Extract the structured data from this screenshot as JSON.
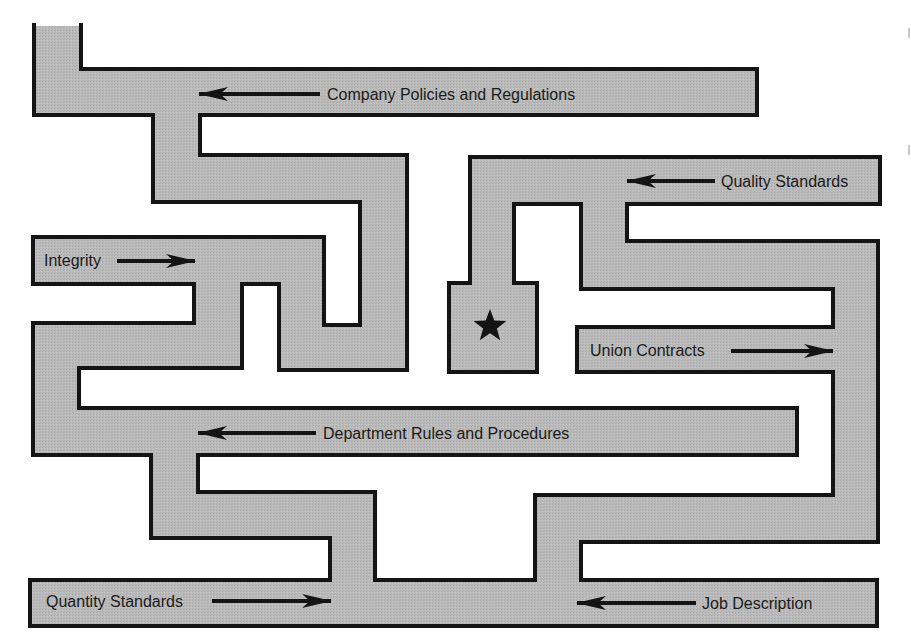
{
  "diagram": {
    "type": "maze",
    "colors": {
      "corridor_fill": "#b9b9b9",
      "corridor_outline": "#141414",
      "background": "#ffffff",
      "text": "#1a1a1a",
      "arrow": "#141414",
      "goal_star": "#141414"
    },
    "goal": {
      "icon": "star-icon",
      "glyph": "★"
    },
    "labels": [
      {
        "id": "company-policies",
        "text": "Company Policies and Regulations",
        "arrow_direction": "left"
      },
      {
        "id": "quality-standards",
        "text": "Quality Standards",
        "arrow_direction": "left"
      },
      {
        "id": "integrity",
        "text": "Integrity",
        "arrow_direction": "right"
      },
      {
        "id": "union-contracts",
        "text": "Union Contracts",
        "arrow_direction": "right"
      },
      {
        "id": "department-rules",
        "text": "Department Rules and Procedures",
        "arrow_direction": "left"
      },
      {
        "id": "quantity-standards",
        "text": "Quantity Standards",
        "arrow_direction": "right"
      },
      {
        "id": "job-description",
        "text": "Job Description",
        "arrow_direction": "left"
      }
    ]
  }
}
